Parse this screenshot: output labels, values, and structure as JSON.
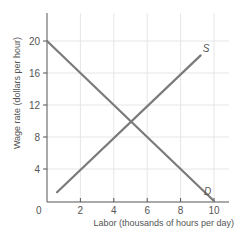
{
  "chart_data": {
    "type": "line",
    "title": "",
    "xlabel": "Labor (thousands of hours per day)",
    "ylabel": "Wage rate (dollars per hour)",
    "xlim": [
      0,
      10.8
    ],
    "ylim": [
      0,
      23.5
    ],
    "x_ticks": [
      0,
      2,
      4,
      6,
      8,
      10
    ],
    "y_ticks": [
      4,
      8,
      12,
      16,
      20
    ],
    "origin_label": "0",
    "grid": true,
    "series": [
      {
        "name": "S",
        "label": "S",
        "points": [
          [
            0.6,
            1.1
          ],
          [
            9.2,
            18.2
          ]
        ],
        "color": "#7a7a7a"
      },
      {
        "name": "D",
        "label": "D",
        "points": [
          [
            0,
            20
          ],
          [
            10,
            0
          ]
        ],
        "color": "#7a7a7a"
      }
    ],
    "equilibrium": {
      "x": 5,
      "y": 10
    }
  },
  "colors": {
    "line": "#7a7a7a",
    "axis": "#555555",
    "grid": "#e6e6e6",
    "text": "#555555"
  }
}
